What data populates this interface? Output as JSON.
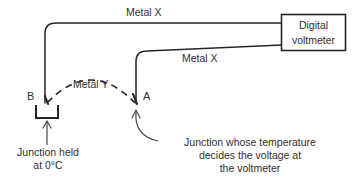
{
  "diagram": {
    "title_alt": "Thermocouple circuit diagram",
    "instrument": {
      "name": "digital-voltmeter",
      "line1": "Digital",
      "line2": "voltmeter"
    },
    "wires": [
      {
        "id": "metal-x-top",
        "label": "Metal X",
        "material": "X"
      },
      {
        "id": "metal-x-bottom",
        "label": "Metal X",
        "material": "X"
      },
      {
        "id": "metal-y",
        "label": "Metal Y",
        "material": "Y",
        "style": "dashed"
      }
    ],
    "junctions": [
      {
        "id": "junction-b",
        "label": "B"
      },
      {
        "id": "junction-a",
        "label": "A"
      }
    ],
    "captions": {
      "left_line1": "Junction held",
      "left_line2": "at 0°C",
      "right_line1": "Junction whose temperature",
      "right_line2": "decides the voltage at",
      "right_line3": "the voltmeter"
    },
    "colors": {
      "background": "#ffffff",
      "stroke": "#262626",
      "text": "#2f2f2f"
    }
  }
}
